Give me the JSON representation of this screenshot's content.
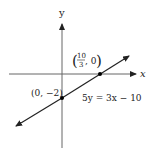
{
  "diagram": {
    "type": "coordinate-plane-line",
    "axes": {
      "x_label": "x",
      "y_label": "y"
    },
    "line": {
      "equation": "5y = 3x − 10"
    },
    "points": [
      {
        "label_num": "10",
        "label_den": "3",
        "label_rest": ", 0",
        "x": "10/3",
        "y": "0"
      },
      {
        "label": "(0, −2)",
        "x": "0",
        "y": "-2"
      }
    ],
    "colors": {
      "ink": "#222222",
      "axis": "#555555",
      "background": "#ffffff"
    }
  }
}
